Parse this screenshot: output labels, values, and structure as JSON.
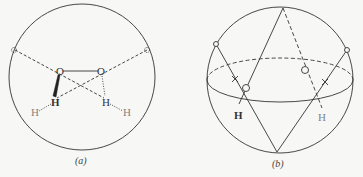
{
  "figure_a": {
    "caption": "(a)",
    "atoms": {
      "oxygen_left": "O",
      "oxygen_right": "O",
      "hydrogen_left": "H",
      "hydrogen_right": "H",
      "hydrogen_dotted_left": "H",
      "hydrogen_dotted_right": "H"
    }
  },
  "figure_b": {
    "caption": "(b)",
    "atoms": {
      "hydrogen_left": "H",
      "hydrogen_right": "H"
    }
  },
  "colors": {
    "line": "#333333",
    "background": "#f7f7f5"
  }
}
